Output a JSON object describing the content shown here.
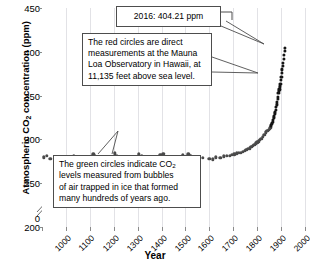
{
  "chart_data": {
    "type": "scatter",
    "title": "",
    "xlabel": "Year",
    "ylabel_parts": {
      "pre": "Atmospheric CO",
      "sub": "2",
      "post": " concentration (ppm)"
    },
    "ylabel_plain": "Atmospheric CO2 concentration (ppm)",
    "xlim": [
      1000,
      2100
    ],
    "ylim": [
      200,
      450
    ],
    "y_axis_break": true,
    "y_break_label": "0",
    "xticks": [
      "1000",
      "1100",
      "1200",
      "1300",
      "1400",
      "1500",
      "1600",
      "1700",
      "1800",
      "1900",
      "2000",
      "2100"
    ],
    "yticks": [
      "450",
      "400",
      "350",
      "300",
      "250",
      "200"
    ],
    "grid": "vertical-only",
    "legend": "none",
    "series": [
      {
        "name": "Ice core bubble measurements (green circles)",
        "color": "#2e7d32",
        "points": [
          [
            1008,
            279.5
          ],
          [
            1020,
            281.0
          ],
          [
            1035,
            278.0
          ],
          [
            1120,
            279.0
          ],
          [
            1132,
            281.5
          ],
          [
            1215,
            283.0
          ],
          [
            1222,
            281.0
          ],
          [
            1305,
            284.0
          ],
          [
            1312,
            281.5
          ],
          [
            1318,
            279.0
          ],
          [
            1405,
            283.0
          ],
          [
            1418,
            281.0
          ],
          [
            1495,
            282.5
          ],
          [
            1502,
            279.0
          ],
          [
            1508,
            283.5
          ],
          [
            1590,
            282.0
          ],
          [
            1600,
            280.0
          ],
          [
            1612,
            283.0
          ],
          [
            1620,
            281.0
          ],
          [
            1655,
            277.0
          ],
          [
            1672,
            279.0
          ],
          [
            1700,
            278.0
          ],
          [
            1715,
            277.5
          ],
          [
            1728,
            279.5
          ],
          [
            1745,
            279.0
          ],
          [
            1760,
            280.5
          ],
          [
            1772,
            281.0
          ],
          [
            1785,
            281.5
          ],
          [
            1795,
            282.5
          ],
          [
            1805,
            283.0
          ],
          [
            1815,
            284.0
          ],
          [
            1822,
            284.5
          ],
          [
            1832,
            285.0
          ],
          [
            1840,
            286.0
          ],
          [
            1848,
            287.0
          ],
          [
            1855,
            288.0
          ],
          [
            1862,
            289.0
          ],
          [
            1868,
            290.0
          ],
          [
            1875,
            291.5
          ],
          [
            1882,
            293.0
          ],
          [
            1888,
            294.0
          ],
          [
            1894,
            295.5
          ],
          [
            1900,
            296.5
          ],
          [
            1906,
            298.0
          ],
          [
            1912,
            299.5
          ],
          [
            1918,
            301.0
          ],
          [
            1924,
            303.0
          ],
          [
            1930,
            305.5
          ],
          [
            1936,
            308.0
          ],
          [
            1942,
            310.0
          ],
          [
            1948,
            311.0
          ],
          [
            1953,
            312.5
          ],
          [
            1957,
            314.0
          ]
        ]
      },
      {
        "name": "Direct measurements at Mauna Loa Observatory (red circles)",
        "color": "#d32f2f",
        "points": [
          [
            1959,
            315.9
          ],
          [
            1961,
            317.6
          ],
          [
            1963,
            319.0
          ],
          [
            1965,
            320.0
          ],
          [
            1967,
            322.1
          ],
          [
            1969,
            324.6
          ],
          [
            1971,
            326.3
          ],
          [
            1973,
            329.6
          ],
          [
            1975,
            331.1
          ],
          [
            1977,
            333.8
          ],
          [
            1979,
            336.8
          ],
          [
            1981,
            339.9
          ],
          [
            1983,
            342.8
          ],
          [
            1985,
            346.0
          ],
          [
            1987,
            348.9
          ],
          [
            1989,
            353.0
          ],
          [
            1991,
            355.5
          ],
          [
            1993,
            357.1
          ],
          [
            1995,
            360.6
          ],
          [
            1997,
            363.7
          ],
          [
            1999,
            368.3
          ],
          [
            2001,
            371.1
          ],
          [
            2003,
            375.8
          ],
          [
            2005,
            379.8
          ],
          [
            2007,
            383.8
          ],
          [
            2009,
            387.4
          ],
          [
            2011,
            391.6
          ],
          [
            2013,
            396.5
          ],
          [
            2015,
            400.8
          ],
          [
            2016,
            404.21
          ]
        ]
      }
    ],
    "annotations": [
      {
        "id": "peak-value",
        "text": "2016: 404.21 ppm",
        "points_to": [
          2016,
          404.21
        ]
      },
      {
        "id": "red-circles-note",
        "lines": [
          "The red circles are direct",
          "measurements at the Mauna",
          "Loa Observatory in Hawaii, at",
          "11,135 feet above sea level."
        ],
        "points_to": [
          2005,
          380
        ]
      },
      {
        "id": "green-circles-note",
        "line1_pre": "The green circles indicate CO",
        "line1_sub": "2",
        "lines_rest": [
          "levels measured from bubbles",
          "of air trapped in ice that formed",
          "many hundreds of years ago."
        ],
        "points_to": [
          1400,
          283
        ]
      }
    ]
  }
}
